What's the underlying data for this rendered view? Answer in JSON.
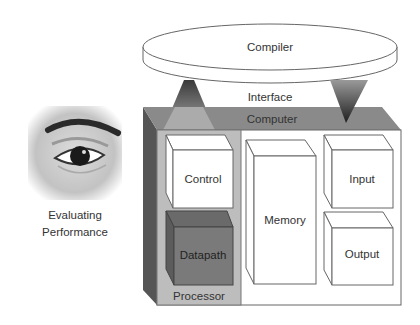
{
  "diagram": {
    "compiler": {
      "label": "Compiler"
    },
    "interface": {
      "label": "Interface"
    },
    "computer": {
      "label": "Computer",
      "processor": {
        "label": "Processor",
        "components": [
          {
            "label": "Control",
            "fill": "#ffffff"
          },
          {
            "label": "Datapath",
            "fill": "#7a7a7a"
          }
        ]
      },
      "memory": {
        "label": "Memory"
      },
      "io": [
        {
          "label": "Input"
        },
        {
          "label": "Output"
        }
      ]
    },
    "evaluation": {
      "caption_line1": "Evaluating",
      "caption_line2": "Performance",
      "icon": "eye-icon"
    }
  },
  "colors": {
    "computer_top": "#8a8a8a",
    "computer_side": "#555555",
    "processor_panel": "#bdbdbd",
    "datapath": "#7a7a7a",
    "outline": "#555555"
  }
}
